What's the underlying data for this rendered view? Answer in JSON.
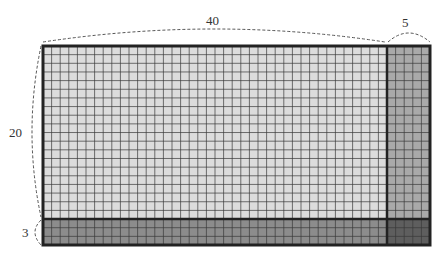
{
  "diagram": {
    "labels": {
      "top_main": "40",
      "top_extra": "5",
      "left_main": "20",
      "left_extra": "3"
    },
    "grid": {
      "main_cols": 40,
      "extra_cols": 5,
      "main_rows": 20,
      "extra_rows": 3
    },
    "colors": {
      "region_main": "#dcdcdc",
      "region_right": "#a9a9a9",
      "region_bottom": "#8c8c8c",
      "region_corner": "#5e5e5e",
      "grid_line": "#3a3a3a",
      "border": "#222222",
      "brace": "#555555"
    }
  }
}
